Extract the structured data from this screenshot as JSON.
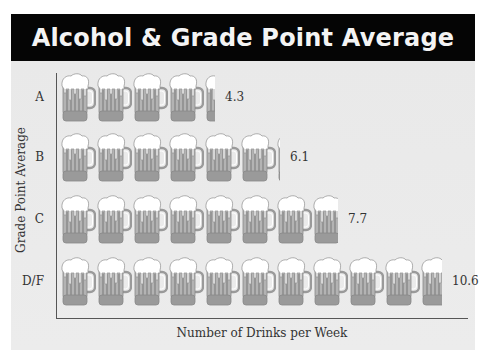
{
  "title": "Alcohol & Grade Point Average",
  "chart_data": {
    "type": "bar",
    "orientation": "horizontal",
    "style": "pictogram",
    "icon": "beer-mug-icon",
    "title": "Alcohol & Grade Point Average",
    "xlabel": "Number of Drinks per Week",
    "ylabel": "Grade Point Average",
    "categories": [
      "A",
      "B",
      "C",
      "D/F"
    ],
    "values": [
      4.3,
      6.1,
      7.7,
      10.6
    ],
    "value_labels": [
      "4.3",
      "6.1",
      "7.7",
      "10.6"
    ],
    "units_per_icon": 1,
    "grid": false,
    "legend": null
  },
  "axes": {
    "x_title": "Number of Drinks per Week",
    "y_title": "Grade Point Average"
  },
  "rows": [
    {
      "category": "A",
      "value": 4.3,
      "value_label": "4.3"
    },
    {
      "category": "B",
      "value": 6.1,
      "value_label": "6.1"
    },
    {
      "category": "C",
      "value": 7.7,
      "value_label": "7.7"
    },
    {
      "category": "D/F",
      "value": 10.6,
      "value_label": "10.6"
    }
  ],
  "colors": {
    "title_band": "#050505",
    "title_text": "#f4f4f4",
    "panel": "#ebebeb",
    "mug_glass": "#b3b3b3",
    "mug_foam": "#ffffff",
    "mug_base": "#9a9a9a",
    "axis": "#555555",
    "text": "#333333"
  }
}
